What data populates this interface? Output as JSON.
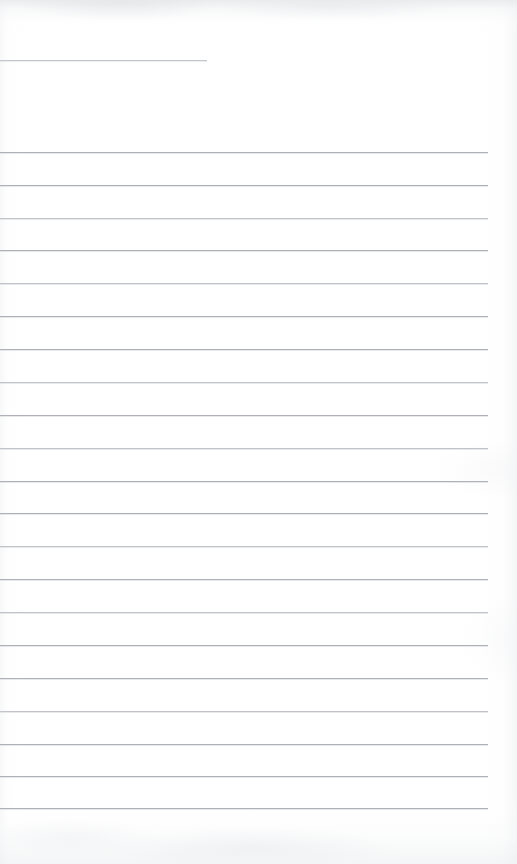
{
  "document": {
    "kind": "scanned-lined-notebook-page",
    "title": "",
    "body_text": "",
    "width": 517,
    "height": 864,
    "background_color": "#ffffff",
    "rule_color": "#b9bcc1",
    "page_tint_color": "#eceef0",
    "is_blank": true,
    "handwriting_present": false,
    "printed_text_present": false
  },
  "header_rule": {
    "label": "",
    "x_start": 0,
    "x_end": 207,
    "y": 60,
    "length": 207,
    "thickness": 1,
    "color": "#c3c6ca"
  },
  "ruling": {
    "line_count": 21,
    "first_line_y": 152,
    "last_line_y": 808,
    "line_spacing": 32.8,
    "x_start": 0,
    "x_end": 488,
    "line_length": 488,
    "right_margin": 29,
    "thickness": 1,
    "color": "#b9bcc1",
    "lines": [
      {
        "index": 1,
        "y": 152,
        "x_start": 0,
        "x_end": 488,
        "ink": "deep",
        "content": ""
      },
      {
        "index": 2,
        "y": 185,
        "x_start": 0,
        "x_end": 488,
        "ink": "deep",
        "content": ""
      },
      {
        "index": 3,
        "y": 218,
        "x_start": 0,
        "x_end": 488,
        "ink": "soft",
        "content": ""
      },
      {
        "index": 4,
        "y": 250,
        "x_start": 0,
        "x_end": 488,
        "ink": "deep",
        "content": ""
      },
      {
        "index": 5,
        "y": 283,
        "x_start": 0,
        "x_end": 488,
        "ink": "soft",
        "content": ""
      },
      {
        "index": 6,
        "y": 316,
        "x_start": 0,
        "x_end": 488,
        "ink": "deep",
        "content": ""
      },
      {
        "index": 7,
        "y": 349,
        "x_start": 0,
        "x_end": 488,
        "ink": "deep",
        "content": ""
      },
      {
        "index": 8,
        "y": 382,
        "x_start": 0,
        "x_end": 488,
        "ink": "soft",
        "content": ""
      },
      {
        "index": 9,
        "y": 415,
        "x_start": 0,
        "x_end": 488,
        "ink": "deep",
        "content": ""
      },
      {
        "index": 10,
        "y": 448,
        "x_start": 0,
        "x_end": 488,
        "ink": "soft",
        "content": ""
      },
      {
        "index": 11,
        "y": 481,
        "x_start": 0,
        "x_end": 488,
        "ink": "deep",
        "content": ""
      },
      {
        "index": 12,
        "y": 513,
        "x_start": 0,
        "x_end": 488,
        "ink": "deep",
        "content": ""
      },
      {
        "index": 13,
        "y": 546,
        "x_start": 0,
        "x_end": 488,
        "ink": "soft",
        "content": ""
      },
      {
        "index": 14,
        "y": 579,
        "x_start": 0,
        "x_end": 488,
        "ink": "deep",
        "content": ""
      },
      {
        "index": 15,
        "y": 612,
        "x_start": 0,
        "x_end": 488,
        "ink": "soft",
        "content": ""
      },
      {
        "index": 16,
        "y": 645,
        "x_start": 0,
        "x_end": 488,
        "ink": "deep",
        "content": ""
      },
      {
        "index": 17,
        "y": 678,
        "x_start": 0,
        "x_end": 488,
        "ink": "deep",
        "content": ""
      },
      {
        "index": 18,
        "y": 711,
        "x_start": 0,
        "x_end": 488,
        "ink": "soft",
        "content": ""
      },
      {
        "index": 19,
        "y": 744,
        "x_start": 0,
        "x_end": 488,
        "ink": "deep",
        "content": ""
      },
      {
        "index": 20,
        "y": 776,
        "x_start": 0,
        "x_end": 488,
        "ink": "deep",
        "content": ""
      },
      {
        "index": 21,
        "y": 808,
        "x_start": 0,
        "x_end": 488,
        "ink": "deep",
        "content": ""
      }
    ]
  },
  "margins": {
    "top_blank_height": 60,
    "gap_header_to_body": 92,
    "bottom_blank_height": 56
  }
}
